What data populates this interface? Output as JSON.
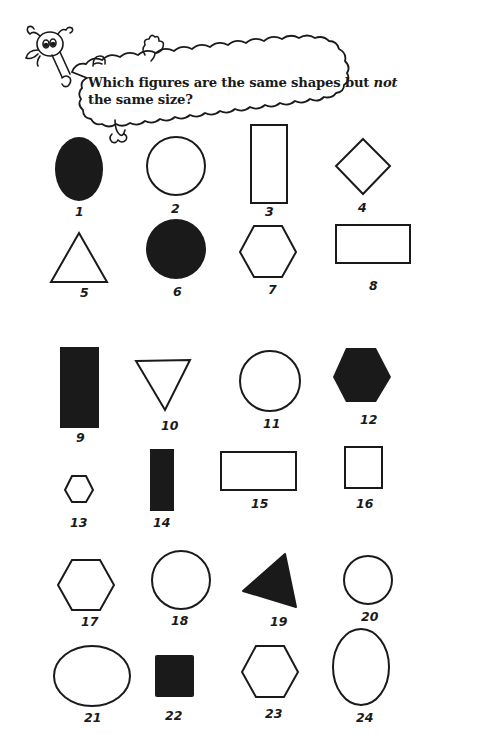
{
  "worksheet": {
    "question_part1": "Which figures are the same shapes but ",
    "question_emphasis": "not",
    "question_part2": " the same size?"
  },
  "figures": [
    {
      "number": "1",
      "shape": "oval",
      "fill": "black"
    },
    {
      "number": "2",
      "shape": "circle",
      "fill": "white"
    },
    {
      "number": "3",
      "shape": "tall-rectangle",
      "fill": "white"
    },
    {
      "number": "4",
      "shape": "diamond",
      "fill": "white"
    },
    {
      "number": "5",
      "shape": "triangle",
      "fill": "white"
    },
    {
      "number": "6",
      "shape": "circle",
      "fill": "black"
    },
    {
      "number": "7",
      "shape": "hexagon",
      "fill": "white"
    },
    {
      "number": "8",
      "shape": "wide-rectangle",
      "fill": "white"
    },
    {
      "number": "9",
      "shape": "tall-rectangle",
      "fill": "black"
    },
    {
      "number": "10",
      "shape": "inverted-triangle",
      "fill": "white"
    },
    {
      "number": "11",
      "shape": "circle",
      "fill": "white"
    },
    {
      "number": "12",
      "shape": "hexagon",
      "fill": "black"
    },
    {
      "number": "13",
      "shape": "hexagon",
      "fill": "white"
    },
    {
      "number": "14",
      "shape": "tall-rectangle",
      "fill": "black"
    },
    {
      "number": "15",
      "shape": "wide-rectangle",
      "fill": "white"
    },
    {
      "number": "16",
      "shape": "square",
      "fill": "white"
    },
    {
      "number": "17",
      "shape": "hexagon",
      "fill": "white"
    },
    {
      "number": "18",
      "shape": "circle",
      "fill": "white"
    },
    {
      "number": "19",
      "shape": "triangle",
      "fill": "black"
    },
    {
      "number": "20",
      "shape": "circle",
      "fill": "white"
    },
    {
      "number": "21",
      "shape": "wide-oval",
      "fill": "white"
    },
    {
      "number": "22",
      "shape": "square",
      "fill": "black"
    },
    {
      "number": "23",
      "shape": "hexagon",
      "fill": "white"
    },
    {
      "number": "24",
      "shape": "tall-oval",
      "fill": "white"
    }
  ],
  "colors": {
    "ink": "#1a1a1a",
    "paper": "#ffffff"
  }
}
